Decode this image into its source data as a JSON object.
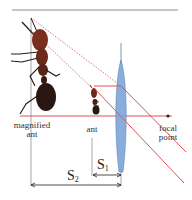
{
  "diagram": {
    "labels": {
      "magnified_ant_line1": "magnified",
      "magnified_ant_line2": "ant",
      "ant": "ant",
      "focal_point_line1": "focal",
      "focal_point_line2": "point",
      "s2_main": "S",
      "s2_sub": "2",
      "s1_main": "S",
      "s1_sub": "1"
    },
    "colors": {
      "ray": "#e0505a",
      "lens": "#7ea6d8",
      "lens_edge": "#4a78b8",
      "axis_gray": "#8a8a8a",
      "ant_body": "#6b2a1a",
      "ant_dark": "#2a1a14",
      "focal_dot": "#3a1a1a"
    }
  }
}
